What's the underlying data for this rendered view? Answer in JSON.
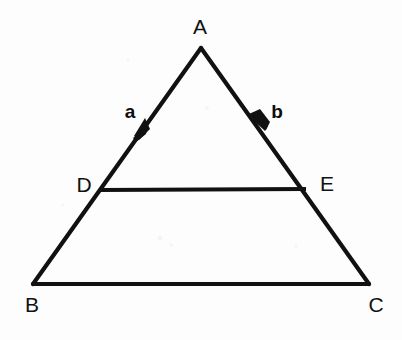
{
  "figure": {
    "title": "Triangle ABC with midsegment DE and vectors a and b",
    "background_color": "#fdfdfd",
    "ink_color": "#111111",
    "canvas": {
      "width": 402,
      "height": 340
    },
    "points": {
      "A": {
        "label": "A",
        "x": 201,
        "y": 48,
        "label_x": 200,
        "label_y": 34
      },
      "B": {
        "label": "B",
        "x": 33,
        "y": 284,
        "label_x": 32,
        "label_y": 312
      },
      "C": {
        "label": "C",
        "x": 369,
        "y": 284,
        "label_x": 376,
        "label_y": 312
      },
      "D": {
        "label": "D",
        "x": 99,
        "y": 190,
        "label_x": 84,
        "label_y": 192
      },
      "E": {
        "label": "E",
        "x": 306,
        "y": 189,
        "label_x": 327,
        "label_y": 191
      }
    },
    "segments": [
      {
        "name": "AB",
        "from": "A",
        "to": "B"
      },
      {
        "name": "AC",
        "from": "A",
        "to": "C"
      },
      {
        "name": "BC",
        "from": "B",
        "to": "C"
      },
      {
        "name": "DE",
        "from": "D",
        "to": "E"
      }
    ],
    "vectors": [
      {
        "name": "a",
        "label": "a",
        "along": "AB",
        "direction": "A-to-B",
        "head_x": 141,
        "head_y": 131,
        "label_x": 130,
        "label_y": 118
      },
      {
        "name": "b",
        "label": "b",
        "along": "AC",
        "direction": "A-to-C",
        "head_x": 259,
        "head_y": 122,
        "label_x": 277,
        "label_y": 118
      }
    ]
  }
}
